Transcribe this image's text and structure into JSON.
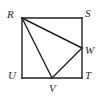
{
  "figure": {
    "type": "geometry-diagram",
    "background_color": "#ffffff",
    "stroke_color": "#231f20",
    "stroke_width": 1.4,
    "label_color": "#2b2b2b",
    "square": {
      "name": "RSTU",
      "corners": {
        "R": {
          "x": 22,
          "y": 18
        },
        "S": {
          "x": 82,
          "y": 18
        },
        "T": {
          "x": 82,
          "y": 78
        },
        "U": {
          "x": 22,
          "y": 78
        }
      },
      "side_length_px": 60
    },
    "points": {
      "W": {
        "x": 82,
        "y": 48,
        "on_segment": "ST"
      },
      "V": {
        "x": 52,
        "y": 78,
        "on_segment": "UT"
      }
    },
    "segments": [
      {
        "name": "RS",
        "from": "R",
        "to": "S"
      },
      {
        "name": "ST",
        "from": "S",
        "to": "T"
      },
      {
        "name": "TU",
        "from": "T",
        "to": "U"
      },
      {
        "name": "UR",
        "from": "U",
        "to": "R"
      },
      {
        "name": "RW",
        "from": "R",
        "to": "W"
      },
      {
        "name": "RV",
        "from": "R",
        "to": "V"
      },
      {
        "name": "VW",
        "from": "V",
        "to": "W"
      }
    ],
    "labels": [
      {
        "id": "R",
        "text": "R",
        "x": 7,
        "y": 9
      },
      {
        "id": "S",
        "text": "S",
        "x": 85,
        "y": 8
      },
      {
        "id": "W",
        "text": "W",
        "x": 85,
        "y": 45
      },
      {
        "id": "U",
        "text": "U",
        "x": 8,
        "y": 70
      },
      {
        "id": "T",
        "text": "T",
        "x": 85,
        "y": 70
      },
      {
        "id": "V",
        "text": "V",
        "x": 49,
        "y": 83
      }
    ]
  }
}
